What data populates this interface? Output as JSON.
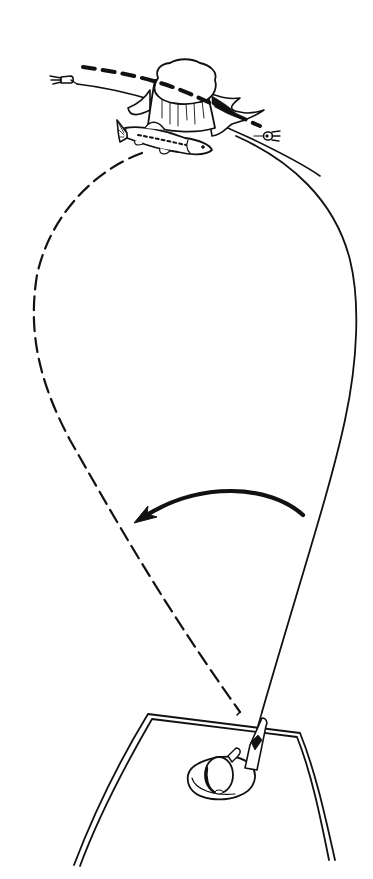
{
  "illustration": {
    "subject": "Casting technique diagram: angler in boat casting a lure past a stump with a bass",
    "background_color": "#ffffff",
    "ink_color": "#111111",
    "elements": [
      {
        "name": "stump",
        "description": "tree stump with spreading roots"
      },
      {
        "name": "bass",
        "description": "fish lying beside the stump"
      },
      {
        "name": "lure-left",
        "description": "lure at left end of retrieve"
      },
      {
        "name": "lure-right",
        "description": "lure at right end of retrieve"
      },
      {
        "name": "retrieve-path-dashed",
        "description": "thick dashed line over the stump"
      },
      {
        "name": "retrieve-path-solid",
        "description": "thin line past the stump"
      },
      {
        "name": "cast-loop-dashed",
        "description": "dashed line looping out to the left"
      },
      {
        "name": "cast-loop-solid",
        "description": "solid line curving out to the right"
      },
      {
        "name": "sweep-arrow",
        "description": "curved arrow pointing from right to left"
      },
      {
        "name": "boat",
        "description": "boat bow seen from above"
      },
      {
        "name": "angler",
        "description": "angler wearing a hat, holding the rod"
      }
    ]
  }
}
